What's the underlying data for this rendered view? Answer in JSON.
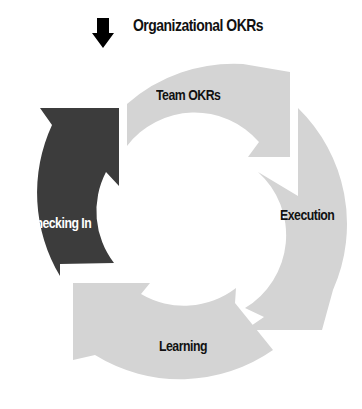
{
  "diagram": {
    "title": "Organizational OKRs",
    "title_icon": "down-arrow-icon",
    "type": "cycle",
    "segments": [
      {
        "label": "Team OKRs",
        "color": "#d4d4d4",
        "text_color": "#111111"
      },
      {
        "label": "Execution",
        "color": "#d4d4d4",
        "text_color": "#111111"
      },
      {
        "label": "Learning",
        "color": "#d4d4d4",
        "text_color": "#111111"
      },
      {
        "label": "Checking In",
        "color": "#3c3c3c",
        "text_color": "#ffffff"
      }
    ]
  },
  "colors": {
    "background": "#ffffff",
    "light_segment": "#d4d4d4",
    "dark_segment": "#3c3c3c",
    "arrow": "#000000"
  }
}
